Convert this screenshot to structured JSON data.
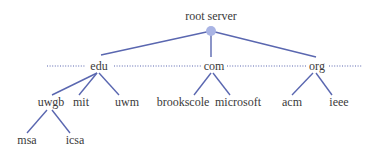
{
  "diagram": {
    "colors": {
      "edge": "#5a67b0",
      "root_node": "#a9b4e4",
      "text": "#3a3a3a"
    },
    "root": {
      "id": "root",
      "label": "root server"
    },
    "nodes": [
      {
        "id": "edu",
        "label": "edu",
        "parent": "root"
      },
      {
        "id": "com",
        "label": "com",
        "parent": "root"
      },
      {
        "id": "org",
        "label": "org",
        "parent": "root"
      },
      {
        "id": "uwgb",
        "label": "uwgb",
        "parent": "edu"
      },
      {
        "id": "mit",
        "label": "mit",
        "parent": "edu"
      },
      {
        "id": "uwm",
        "label": "uwm",
        "parent": "edu"
      },
      {
        "id": "brookscole",
        "label": "brookscole",
        "parent": "com"
      },
      {
        "id": "microsoft",
        "label": "microsoft",
        "parent": "com"
      },
      {
        "id": "acm",
        "label": "acm",
        "parent": "org"
      },
      {
        "id": "ieee",
        "label": "ieee",
        "parent": "org"
      },
      {
        "id": "msa",
        "label": "msa",
        "parent": "uwgb"
      },
      {
        "id": "icsa",
        "label": "icsa",
        "parent": "uwgb"
      }
    ],
    "ellipsis_note": "dotted lines indicate additional top-level domains"
  }
}
